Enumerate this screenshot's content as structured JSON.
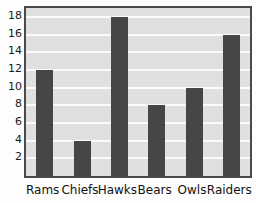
{
  "chart_data": {
    "type": "bar",
    "title": "",
    "subtitle": "",
    "xlabel": "",
    "ylabel": "",
    "categories": [
      "Rams",
      "Chiefs",
      "Hawks",
      "Bears",
      "Owls",
      "Raiders"
    ],
    "values": [
      12,
      4,
      18,
      8,
      10,
      16
    ],
    "ylim": [
      0,
      19
    ],
    "yticks": [
      2,
      4,
      6,
      8,
      10,
      12,
      14,
      16,
      18
    ],
    "ytick_labels": [
      "2",
      "4",
      "6",
      "8",
      "10",
      "12",
      "14",
      "16",
      "18"
    ],
    "grid": true,
    "grid_axis": "y",
    "legend": false,
    "legend_position": "none",
    "annotations": []
  },
  "style": {
    "bar_color": "#464646",
    "plot_background": "#e0e0e0",
    "gridline_color": "#fbfbfb",
    "frame_color": "#4a4a4a",
    "page_background": "#fdfdfd",
    "tick_label_color": "#1a1a1a",
    "category_label_color": "#121212"
  }
}
